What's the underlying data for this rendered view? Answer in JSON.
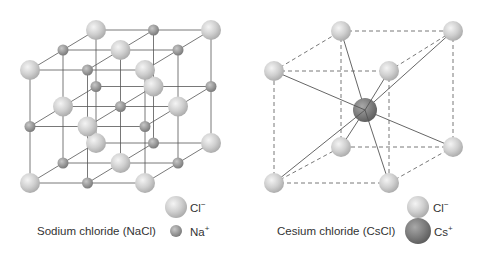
{
  "diagrams": [
    {
      "id": "nacl",
      "caption": "Sodium chloride (NaCl)",
      "legend": [
        {
          "symbol": "Cl",
          "charge": "−",
          "type": "large-light"
        },
        {
          "symbol": "Na",
          "charge": "+",
          "type": "small-gray"
        }
      ],
      "lattice": "face-centered cubic (3×3×3 alternating)"
    },
    {
      "id": "cscl",
      "caption": "Cesium chloride (CsCl)",
      "legend": [
        {
          "symbol": "Cl",
          "charge": "−",
          "type": "light"
        },
        {
          "symbol": "Cs",
          "charge": "+",
          "type": "dark"
        }
      ],
      "lattice": "body-centered cubic"
    }
  ],
  "colors": {
    "cl_light": "#d4d4d4",
    "na_gray": "#9a9a9a",
    "cs_dark": "#777777",
    "line": "#555555"
  }
}
